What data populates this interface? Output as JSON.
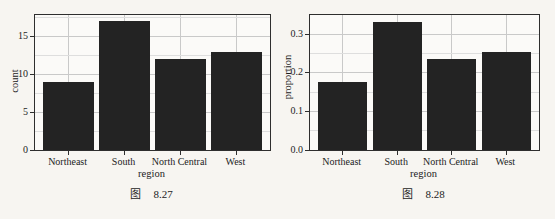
{
  "captions": [
    {
      "prefix": "图",
      "number": "8.27"
    },
    {
      "prefix": "图",
      "number": "8.28"
    }
  ],
  "chart_data": [
    {
      "type": "bar",
      "title": "",
      "categories": [
        "Northeast",
        "South",
        "North Central",
        "West"
      ],
      "values": [
        9,
        17,
        12,
        13
      ],
      "xlabel": "region",
      "ylabel": "count",
      "yticks": [
        0,
        5,
        10,
        15
      ],
      "ytick_labels": [
        "0",
        "5",
        "10",
        "15"
      ],
      "minor_yticks": [
        2.5,
        7.5,
        12.5,
        17.5
      ],
      "ylim": [
        0,
        17.85
      ],
      "grid": "major+minor horizontal, major vertical at category centers",
      "legend": "none",
      "bar_color": "#232323"
    },
    {
      "type": "bar",
      "title": "",
      "categories": [
        "Northeast",
        "South",
        "North Central",
        "West"
      ],
      "values": [
        0.176,
        0.333,
        0.235,
        0.255
      ],
      "xlabel": "region",
      "ylabel": "proportion",
      "yticks": [
        0,
        0.1,
        0.2,
        0.3
      ],
      "ytick_labels": [
        "0.0",
        "0.1",
        "0.2",
        "0.3"
      ],
      "minor_yticks": [
        0.05,
        0.15,
        0.25,
        0.35
      ],
      "ylim": [
        0,
        0.35
      ],
      "grid": "major+minor horizontal, major vertical at category centers",
      "legend": "none",
      "bar_color": "#232323"
    }
  ],
  "colors": {
    "bar": "#232323",
    "panel_border": "#2e2e2e",
    "grid_major": "#c9c9c9",
    "grid_minor": "#dedede",
    "page_bg": "#f7f5f1",
    "panel_bg": "#fbfaf8",
    "text": "#1c1c1c"
  }
}
